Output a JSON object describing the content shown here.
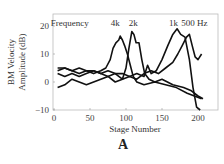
{
  "chart_data": {
    "type": "line",
    "title": "",
    "xlabel": "Stage Number",
    "ylabel": [
      "BM Velocity",
      "Amplitude (dB)"
    ],
    "xlim": [
      0,
      228
    ],
    "ylim": [
      -10,
      24
    ],
    "xticks": [
      0,
      50,
      100,
      150,
      200
    ],
    "yticks": [
      -10,
      0,
      10,
      20
    ],
    "grid": false,
    "legend_label": "Frequency",
    "panel_label": "A",
    "series": [
      {
        "name": "4k",
        "x": [
          5,
          15,
          25,
          35,
          45,
          55,
          65,
          72,
          78,
          82,
          86,
          90,
          92,
          95,
          98,
          102,
          106,
          110,
          115,
          125,
          140,
          155,
          170,
          185,
          195,
          205
        ],
        "y": [
          4,
          5,
          4,
          3,
          4,
          3,
          4,
          5,
          8,
          12,
          14,
          15,
          16.4,
          15,
          13,
          10,
          6,
          2,
          0,
          -1,
          0,
          -1,
          -2,
          -4,
          -5,
          -6
        ]
      },
      {
        "name": "2k",
        "x": [
          5,
          15,
          25,
          35,
          45,
          55,
          65,
          75,
          85,
          95,
          100,
          104,
          108,
          111,
          114,
          118,
          122,
          126,
          132,
          140,
          150,
          165,
          180,
          190,
          200,
          207
        ],
        "y": [
          3,
          2,
          3,
          2,
          3,
          4,
          3,
          2,
          3,
          1,
          5,
          12,
          18,
          17,
          14,
          14,
          8,
          3,
          1,
          0,
          1,
          -1,
          -2,
          -3,
          -5,
          -6
        ]
      },
      {
        "name": "1k",
        "x": [
          5,
          15,
          25,
          35,
          45,
          55,
          65,
          75,
          85,
          95,
          105,
          115,
          125,
          130,
          135,
          142,
          150,
          158,
          165,
          171,
          176,
          182,
          188,
          193,
          198,
          203
        ],
        "y": [
          5,
          5,
          4,
          5,
          4,
          4,
          3,
          4,
          3,
          3,
          2,
          3,
          2,
          6,
          3,
          4,
          8,
          13,
          17,
          19,
          17,
          16,
          8,
          -2,
          -9,
          -10
        ]
      },
      {
        "name": "500 Hz",
        "x": [
          5,
          15,
          25,
          35,
          45,
          55,
          65,
          75,
          85,
          95,
          105,
          115,
          125,
          135,
          145,
          155,
          165,
          172,
          178,
          184,
          188,
          192,
          196,
          200,
          205
        ],
        "y": [
          -2,
          -1,
          1,
          0,
          -1,
          0,
          1,
          2,
          0,
          1,
          2,
          1,
          3,
          4,
          3,
          5,
          7,
          10,
          13,
          16,
          17,
          13,
          9,
          8,
          10
        ]
      }
    ],
    "annotations": [
      {
        "text": "Frequency",
        "x": 22,
        "y": 21
      },
      {
        "text": "4k",
        "x": 85,
        "y": 21
      },
      {
        "text": "2k",
        "x": 110,
        "y": 21
      },
      {
        "text": "1k",
        "x": 166,
        "y": 21
      },
      {
        "text": "500 Hz",
        "x": 195,
        "y": 21
      }
    ]
  },
  "style": {
    "line_color": "#111111",
    "axis_color": "#999999",
    "text_color": "#333333"
  }
}
